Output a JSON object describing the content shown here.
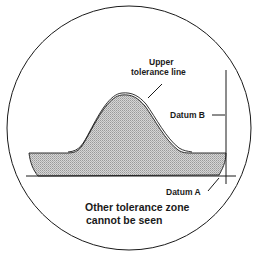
{
  "diagram": {
    "labels": {
      "upper_tolerance_line_1": "Upper",
      "upper_tolerance_line_2": "tolerance line",
      "datum_b": "Datum B",
      "datum_a": "Datum A",
      "caption_1": "Other tolerance zone",
      "caption_2": "cannot be seen"
    },
    "colors": {
      "stroke": "#1a1a1a",
      "fill": "#c8c8c8",
      "background": "#ffffff"
    }
  }
}
